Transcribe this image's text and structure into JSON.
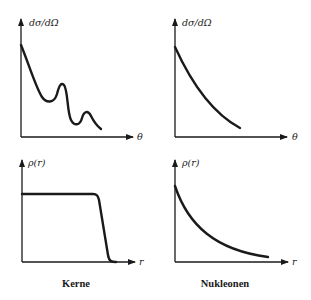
{
  "panels": [
    {
      "id": "kerne-cross-section",
      "ylabel": "dσ/dΩ",
      "xlabel": "θ",
      "shape": "decreasing with diffraction minima/maxima"
    },
    {
      "id": "nukleonen-cross-section",
      "ylabel": "dσ/dΩ",
      "xlabel": "θ",
      "shape": "smooth monotonic decrease"
    },
    {
      "id": "kerne-density",
      "ylabel": "ρ(r)",
      "xlabel": "r",
      "shape": "flat plateau with sharp edge falloff"
    },
    {
      "id": "nukleonen-density",
      "ylabel": "ρ(r)",
      "xlabel": "r",
      "shape": "exponential-like decay"
    }
  ],
  "captions": {
    "left": "Kerne",
    "right": "Nukleonen"
  },
  "colors": {
    "ink": "#1a1a1a",
    "background": "#ffffff"
  }
}
